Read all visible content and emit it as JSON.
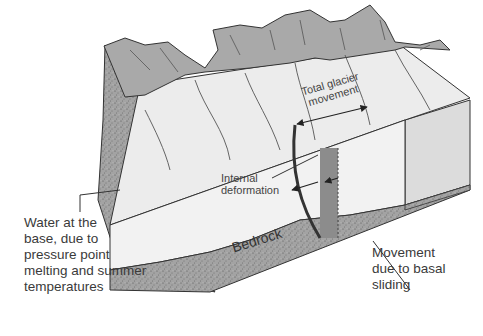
{
  "diagram": {
    "labels": {
      "total_movement": "Total glacier\nmovement",
      "internal_deformation": "Internal\ndeformation",
      "water_at_base": "Water at the\nbase, due to\npressure point\nmelting and summer\ntemperatures",
      "bedrock": "Bedrock",
      "basal_sliding": "Movement\ndue to basal\nsliding"
    },
    "colors": {
      "ice_top": "#ececec",
      "ice_front": "#f2f2f2",
      "mountains": "#a9a9a9",
      "rock": "#9a9a9a",
      "rock_dark": "#7d7d7d",
      "basal_band": "#8c8c8c",
      "line": "#333333",
      "text": "#3a3a3a"
    }
  }
}
